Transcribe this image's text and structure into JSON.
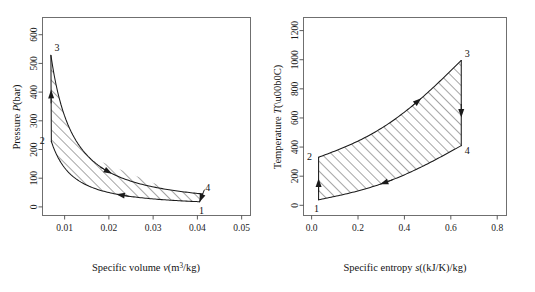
{
  "figure": {
    "background": "#ffffff",
    "ink": "#1a1a1a",
    "axis_color": "#6f6f6f"
  },
  "chart_data": [
    {
      "id": "pv-diagram",
      "type": "line",
      "title": "",
      "xlabel_plain": "Specific volume v(m3/kg)",
      "xlabel_parts": {
        "lead": "Specific volume ",
        "symbol": "v",
        "units": "(m",
        "sup": "3",
        "units_tail": "/kg)"
      },
      "ylabel_plain": "Pressure P(bar)",
      "ylabel_parts": {
        "lead": "Pressure ",
        "symbol": "P",
        "units": "(bar)"
      },
      "xlim": [
        0.005,
        0.052
      ],
      "ylim": [
        -30,
        660
      ],
      "xticks": [
        0.01,
        0.02,
        0.03,
        0.04,
        0.05
      ],
      "xticklabels": [
        "0.01",
        "0.02",
        "0.03",
        "0.04",
        "0.05"
      ],
      "yticks": [
        0,
        100,
        200,
        300,
        400,
        500,
        600
      ],
      "yticklabels": [
        "0",
        "100",
        "200",
        "300",
        "400",
        "500",
        "600"
      ],
      "grid": false,
      "legend": "none",
      "state_points": [
        {
          "label": "1",
          "v": 0.0405,
          "P": 18,
          "label_dx": 2,
          "label_dy": 12
        },
        {
          "label": "2",
          "v": 0.007,
          "P": 228,
          "label_dx": -9,
          "label_dy": 3
        },
        {
          "label": "3",
          "v": 0.0069,
          "P": 528,
          "label_dx": 6,
          "label_dy": -4
        },
        {
          "label": "4",
          "v": 0.0412,
          "P": 45,
          "label_dx": 5,
          "label_dy": -3
        }
      ],
      "processes": [
        {
          "name": "1-2 compression",
          "from": "1",
          "to": "2",
          "direction": "right-to-left",
          "arrow_at": 0.46
        },
        {
          "name": "2-3 heat addition",
          "from": "2",
          "to": "3",
          "direction": "upward",
          "arrow_at": 0.55
        },
        {
          "name": "3-4 expansion",
          "from": "3",
          "to": "4",
          "direction": "left-to-right",
          "arrow_at": 0.58
        },
        {
          "name": "4-1 heat rejection",
          "from": "4",
          "to": "1",
          "direction": "downward",
          "arrow_at": 0.55
        }
      ],
      "area_shading": "hatched-45deg"
    },
    {
      "id": "ts-diagram",
      "type": "line",
      "title": "",
      "xlabel_plain": "Specific entropy s((kJ/K)/kg)",
      "xlabel_parts": {
        "lead": "Specific entropy ",
        "symbol": "s",
        "units": "((kJ/K)/kg)"
      },
      "ylabel_plain": "Temperature T(°C)",
      "ylabel_parts": {
        "lead": "Temperature ",
        "symbol": "T",
        "units": "(°C)"
      },
      "xlim": [
        -0.035,
        0.84
      ],
      "ylim": [
        -70,
        1290
      ],
      "xticks": [
        0.0,
        0.2,
        0.4,
        0.6,
        0.8
      ],
      "xticklabels": [
        "0.0",
        "0.2",
        "0.4",
        "0.6",
        "0.8"
      ],
      "yticks": [
        0,
        200,
        400,
        600,
        800,
        1000,
        1200
      ],
      "yticklabels": [
        "0",
        "200",
        "400",
        "600",
        "800",
        "1000",
        "1200"
      ],
      "grid": false,
      "legend": "none",
      "state_points": [
        {
          "label": "1",
          "s": 0.03,
          "T": 38,
          "label_dx": -2,
          "label_dy": 12
        },
        {
          "label": "2",
          "s": 0.03,
          "T": 330,
          "label_dx": -9,
          "label_dy": 3
        },
        {
          "label": "3",
          "s": 0.645,
          "T": 995,
          "label_dx": 6,
          "label_dy": -3
        },
        {
          "label": "4",
          "s": 0.645,
          "T": 410,
          "label_dx": 6,
          "label_dy": 8
        }
      ],
      "processes": [
        {
          "name": "1-2 compression",
          "from": "1",
          "to": "2",
          "direction": "upward",
          "arrow_at": 0.4
        },
        {
          "name": "2-3 heat addition",
          "from": "2",
          "to": "3",
          "direction": "left-to-right",
          "arrow_at": 0.66
        },
        {
          "name": "3-4 expansion",
          "from": "3",
          "to": "4",
          "direction": "downward",
          "arrow_at": 0.62
        },
        {
          "name": "4-1 heat rejection",
          "from": "4",
          "to": "1",
          "direction": "right-to-left",
          "arrow_at": 0.56
        }
      ],
      "area_shading": "hatched-45deg"
    }
  ]
}
